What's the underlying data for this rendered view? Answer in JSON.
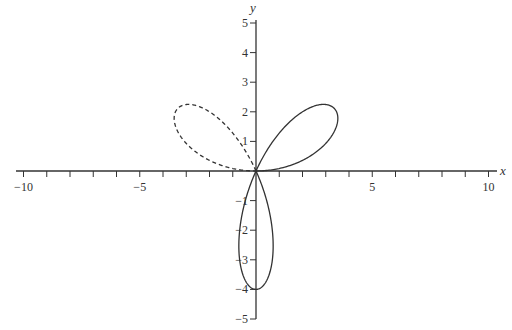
{
  "chart_data": {
    "type": "line",
    "title": "",
    "xlabel": "x",
    "ylabel": "y",
    "xlim": [
      -10,
      10
    ],
    "ylim": [
      -5,
      5
    ],
    "grid": false,
    "legend": null,
    "x_ticks": [
      -10,
      -9,
      -8,
      -7,
      -6,
      -5,
      -4,
      -3,
      -2,
      -1,
      0,
      1,
      2,
      3,
      4,
      5,
      6,
      7,
      8,
      9,
      10
    ],
    "x_tick_labels": [
      "-10",
      "-5",
      "5",
      "10"
    ],
    "y_ticks": [
      -5,
      -4,
      -3,
      -2,
      -1,
      0,
      1,
      2,
      3,
      4,
      5
    ],
    "y_tick_labels": [
      "-5",
      "-4",
      "-3",
      "-2",
      "-1",
      "1",
      "2",
      "3",
      "4",
      "5"
    ],
    "series": [
      {
        "name": "upper petals (solid)",
        "style": "solid",
        "equation": "r = 4 sin(3θ), 0 ≤ θ ≤ 2π/3",
        "key_points": [
          [
            0,
            0
          ],
          [
            3.46,
            2.0
          ],
          [
            0,
            0
          ],
          [
            -3.46,
            2.0
          ],
          [
            0,
            0
          ]
        ]
      },
      {
        "name": "lower petal (dashed)",
        "style": "dashed",
        "equation": "r = 4 sin(3θ), 2π/3 ≤ θ ≤ π",
        "key_points": [
          [
            0,
            0
          ],
          [
            0,
            -4
          ],
          [
            0,
            0
          ]
        ]
      }
    ]
  },
  "axes": {
    "x_label": "x",
    "y_label": "y",
    "x_label_values": [
      {
        "v": -10,
        "t": "−10"
      },
      {
        "v": -5,
        "t": "−5"
      },
      {
        "v": 5,
        "t": "5"
      },
      {
        "v": 10,
        "t": "10"
      }
    ],
    "y_label_values": [
      {
        "v": 5,
        "t": "5"
      },
      {
        "v": 4,
        "t": "4"
      },
      {
        "v": 3,
        "t": "3"
      },
      {
        "v": 2,
        "t": "2"
      },
      {
        "v": 1,
        "t": "1"
      },
      {
        "v": -1,
        "t": "−1"
      },
      {
        "v": -2,
        "t": "−2"
      },
      {
        "v": -3,
        "t": "−3"
      },
      {
        "v": -4,
        "t": "−4"
      },
      {
        "v": -5,
        "t": "−5"
      }
    ]
  },
  "colors": {
    "curve": "#333333",
    "axis": "#333333"
  }
}
